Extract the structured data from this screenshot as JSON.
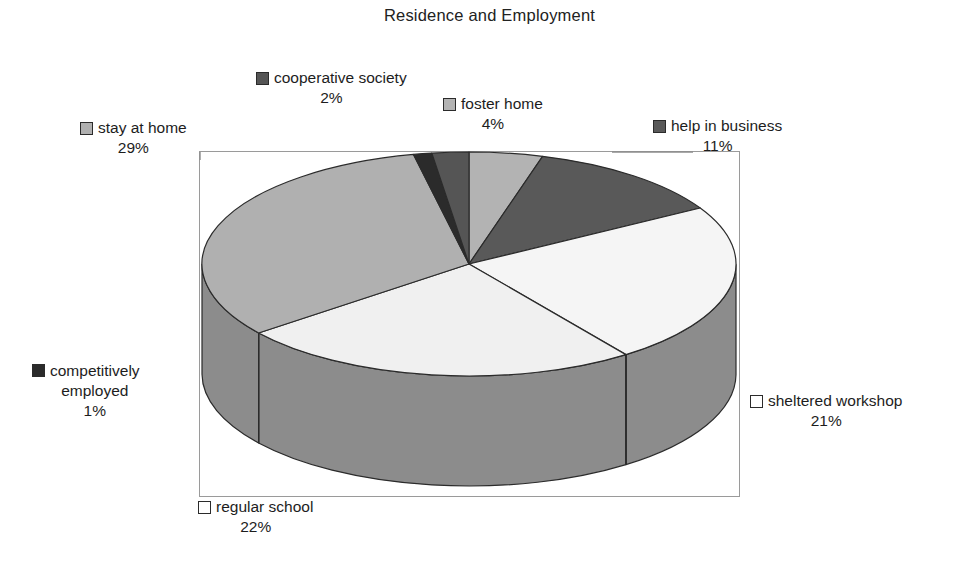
{
  "chart_data": {
    "type": "pie",
    "title": "Residence and Employment",
    "subtitle": "",
    "xlabel": "",
    "ylabel": "",
    "legend_position": "callout-labels",
    "grid": false,
    "three_d": true,
    "start_angle_deg": 0,
    "direction": "clockwise",
    "total": 100,
    "unit": "%",
    "categories": [
      "foster home",
      "help in business",
      "sheltered workshop",
      "regular school",
      "stay at home",
      "competitively employed",
      "cooperative society"
    ],
    "values": [
      4,
      11,
      21,
      22,
      29,
      1,
      2
    ],
    "slices": [
      {
        "label": "foster home",
        "value": 4,
        "pct_text": "4%",
        "color": "#b3b3b3",
        "side_color": "#9a9a9a"
      },
      {
        "label": "help in business",
        "value": 11,
        "pct_text": "11%",
        "color": "#595959",
        "side_color": "#4a4a4a"
      },
      {
        "label": "sheltered workshop",
        "value": 21,
        "pct_text": "21%",
        "color": "#f5f5f5",
        "side_color": "#8c8c8c"
      },
      {
        "label": "regular school",
        "value": 22,
        "pct_text": "22%",
        "color": "#f0f0f0",
        "side_color": "#8c8c8c"
      },
      {
        "label": "stay at home",
        "value": 29,
        "pct_text": "29%",
        "color": "#b0b0b0",
        "side_color": "#8c8c8c"
      },
      {
        "label": "competitively employed",
        "value": 1,
        "pct_text": "1%",
        "color": "#2b2b2b",
        "side_color": "#262626"
      },
      {
        "label": "cooperative society",
        "value": 2,
        "pct_text": "2%",
        "color": "#555555",
        "side_color": "#474747"
      }
    ]
  },
  "title": {
    "text": "Residence and Employment"
  },
  "labels": {
    "cooperative_society": {
      "name": "cooperative society",
      "pct": "2%",
      "swatch": "#555555"
    },
    "foster_home": {
      "name": "foster home",
      "pct": "4%",
      "swatch": "#b3b3b3"
    },
    "help_in_business": {
      "name": "help in business",
      "pct": "11%",
      "swatch": "#595959"
    },
    "stay_at_home": {
      "name": "stay at home",
      "pct": "29%",
      "swatch": "#b0b0b0"
    },
    "competitively_employed": {
      "line1": "competitively",
      "line2": "employed",
      "pct": "1%",
      "swatch": "#2b2b2b"
    },
    "sheltered_workshop": {
      "name": "sheltered workshop",
      "pct": "21%",
      "swatch": "#ffffff"
    },
    "regular_school": {
      "name": "regular school",
      "pct": "22%",
      "swatch": "#ffffff"
    }
  },
  "plot": {
    "frame_color": "#9a9a9a",
    "background": "#ffffff"
  }
}
